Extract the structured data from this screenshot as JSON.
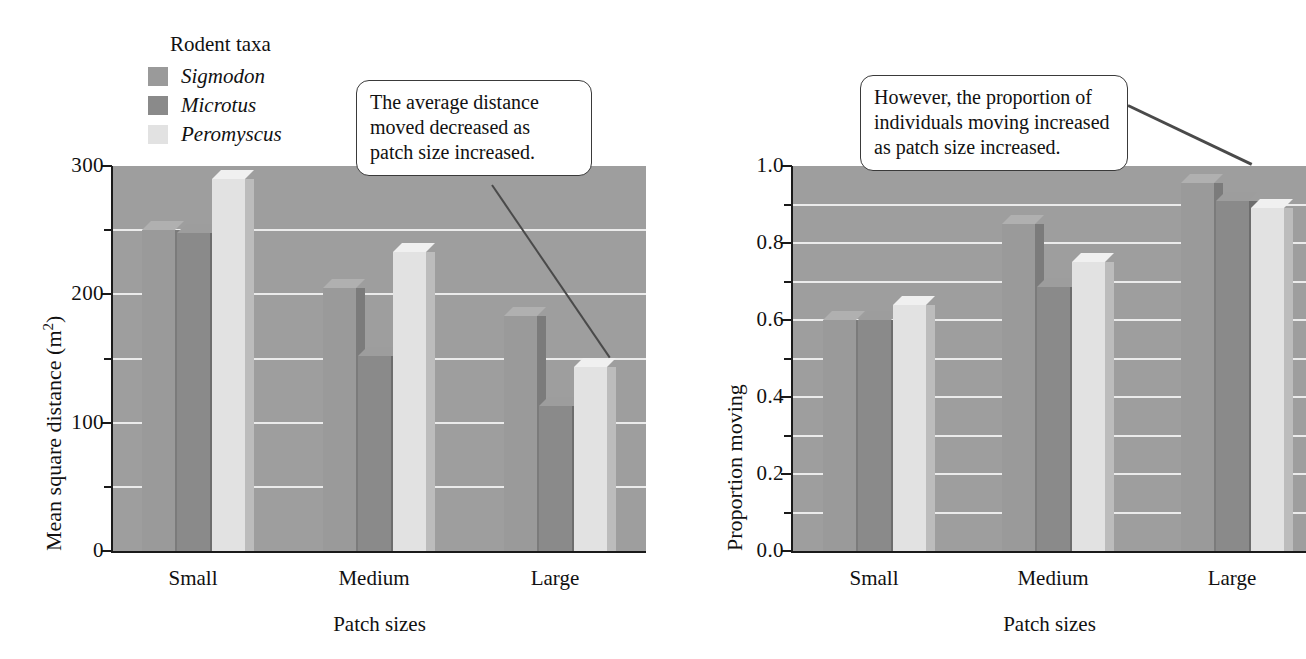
{
  "figure": {
    "legend": {
      "title": "Rodent taxa",
      "items": [
        {
          "name": "Sigmodon",
          "color": "#9a9a9a"
        },
        {
          "name": "Microtus",
          "color": "#8a8a8a"
        },
        {
          "name": "Peromyscus",
          "color": "#e2e2e2"
        }
      ]
    },
    "callouts": [
      {
        "id": "callout-left",
        "text": "The average distance moved decreased as patch size increased."
      },
      {
        "id": "callout-right",
        "text": "However, the proportion of individuals moving increased as patch size increased."
      }
    ]
  },
  "chart_data": [
    {
      "type": "bar",
      "title": "",
      "xlabel": "Patch sizes",
      "ylabel": "Mean square distance (m2)",
      "ylabel_html": "Mean square distance (m<sup>2</sup>)",
      "categories": [
        "Small",
        "Medium",
        "Large"
      ],
      "series": [
        {
          "name": "Sigmodon",
          "values": [
            250,
            205,
            183
          ]
        },
        {
          "name": "Microtus",
          "values": [
            248,
            152,
            113
          ]
        },
        {
          "name": "Peromyscus",
          "values": [
            290,
            233,
            143
          ]
        }
      ],
      "ylim": [
        0,
        300
      ],
      "yticks": [
        0,
        100,
        200,
        300
      ],
      "yticklabels": [
        "0",
        "100",
        "200",
        "300"
      ],
      "yminorticks": [
        50,
        150,
        250
      ],
      "gridlines": [
        50,
        100,
        150,
        200,
        250
      ],
      "grid": true,
      "legend_position": "upper-left-outside",
      "plot_background": "#9e9e9e",
      "gridline_color": "#f2f2f2"
    },
    {
      "type": "bar",
      "title": "",
      "xlabel": "Patch sizes",
      "ylabel": "Proportion moving",
      "categories": [
        "Small",
        "Medium",
        "Large"
      ],
      "series": [
        {
          "name": "Sigmodon",
          "values": [
            0.6,
            0.85,
            0.955
          ]
        },
        {
          "name": "Microtus",
          "values": [
            0.6,
            0.685,
            0.91
          ]
        },
        {
          "name": "Peromyscus",
          "values": [
            0.64,
            0.75,
            0.89
          ]
        }
      ],
      "ylim": [
        0,
        1.0
      ],
      "yticks": [
        0.0,
        0.2,
        0.4,
        0.6,
        0.8,
        1.0
      ],
      "yticklabels": [
        "0.0",
        "0.2",
        "0.4",
        "0.6",
        "0.8",
        "1.0"
      ],
      "yminorticks": [
        0.1,
        0.3,
        0.5,
        0.7,
        0.9
      ],
      "gridlines": [
        0.1,
        0.2,
        0.3,
        0.4,
        0.5,
        0.6,
        0.7,
        0.8,
        0.9
      ],
      "grid": true,
      "legend_position": "none",
      "plot_background": "#9e9e9e",
      "gridline_color": "#f2f2f2"
    }
  ]
}
